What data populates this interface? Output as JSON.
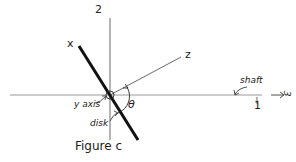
{
  "figure": {
    "caption": "Figure c",
    "labels": {
      "axis_2": "2",
      "axis_x": "x",
      "axis_z": "z",
      "axis_1": "1",
      "axis_3": "3",
      "shaft": "shaft",
      "y_axis": "y axis",
      "disk": "disk",
      "theta": "θ"
    },
    "colors": {
      "ink": "#222222",
      "shaft_line": "#999999"
    }
  }
}
